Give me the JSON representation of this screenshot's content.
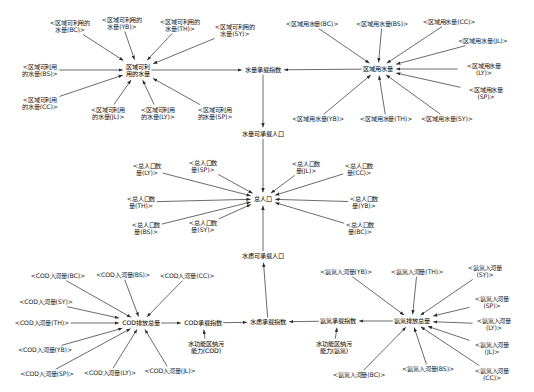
{
  "diagram": {
    "type": "causal-loop-diagram",
    "width": 534,
    "height": 392,
    "edge_color": "#2b2b2b",
    "text_color": "#141414",
    "background": "#ffffff",
    "regions": [
      "BC",
      "BS",
      "CC",
      "JL",
      "LY",
      "SP",
      "SY",
      "TH",
      "YB"
    ],
    "nodes": [
      {
        "id": "water_avail_BC",
        "label": "<区域可利用的\n水量(BC)>",
        "x": 70,
        "y": 26,
        "kind": "shadow"
      },
      {
        "id": "water_avail_YB",
        "label": "<区域可利用的\n水量(YB)>",
        "x": 122,
        "y": 23,
        "kind": "shadow"
      },
      {
        "id": "water_avail_TH",
        "label": "<区域可利用的\n水量(TH)>",
        "x": 180,
        "y": 25,
        "kind": "shadow"
      },
      {
        "id": "water_avail_SY",
        "label": "<区域可利用的\n水量(SY)>",
        "x": 235,
        "y": 30,
        "kind": "shadow"
      },
      {
        "id": "water_avail_BS",
        "label": "<区域可利用\n的水量(BS)>",
        "x": 40,
        "y": 70,
        "kind": "shadow"
      },
      {
        "id": "water_avail_CC",
        "label": "<区域可利用\n的水量(CC)>",
        "x": 40,
        "y": 103,
        "kind": "shadow"
      },
      {
        "id": "water_avail_JL",
        "label": "<区域可利用\n的水量(JL)>",
        "x": 108,
        "y": 113,
        "kind": "shadow"
      },
      {
        "id": "water_avail_LY",
        "label": "<区域可利用\n的水量(LY)>",
        "x": 158,
        "y": 113,
        "kind": "shadow"
      },
      {
        "id": "water_avail_SP",
        "label": "<区域可利用\n的水量(SP)>",
        "x": 215,
        "y": 113,
        "kind": "shadow"
      },
      {
        "id": "water_avail",
        "label": "区域可利\n用的水量",
        "x": 138,
        "y": 70,
        "kind": "core"
      },
      {
        "id": "water_use_BC",
        "label": "<区域用水量(BC)>",
        "x": 312,
        "y": 24,
        "kind": "shadow"
      },
      {
        "id": "water_use_BS",
        "label": "<区域用水量(BS)>",
        "x": 382,
        "y": 24,
        "kind": "shadow"
      },
      {
        "id": "water_use_CC",
        "label": "<区域用水量(CC)>",
        "x": 449,
        "y": 22,
        "kind": "shadow"
      },
      {
        "id": "water_use_JL",
        "label": "<区域用水量(JL)>",
        "x": 483,
        "y": 41,
        "kind": "shadow"
      },
      {
        "id": "water_use_LY",
        "label": "<区域用水量(LY)>",
        "x": 484,
        "y": 69,
        "kind": "shadow"
      },
      {
        "id": "water_use_SP",
        "label": "<区域用水量(SP)>",
        "x": 486,
        "y": 93,
        "kind": "shadow"
      },
      {
        "id": "water_use_YB",
        "label": "<区域用水量(YB)>",
        "x": 318,
        "y": 119,
        "kind": "shadow"
      },
      {
        "id": "water_use_TH",
        "label": "<区域用水量(TH)>",
        "x": 386,
        "y": 119,
        "kind": "shadow"
      },
      {
        "id": "water_use_SY",
        "label": "<区域用水量(SY)>",
        "x": 447,
        "y": 119,
        "kind": "shadow"
      },
      {
        "id": "water_use",
        "label": "区域用水量",
        "x": 378,
        "y": 69,
        "kind": "core"
      },
      {
        "id": "water_qty_index",
        "label": "水量承载指数",
        "x": 263,
        "y": 70,
        "kind": "core"
      },
      {
        "id": "water_qty_pop",
        "label": "水量可承载人口",
        "x": 263,
        "y": 134,
        "kind": "core"
      },
      {
        "id": "pop_LY",
        "label": "<总人口数\n量(LY)>",
        "x": 147,
        "y": 169,
        "kind": "shadow"
      },
      {
        "id": "pop_SP",
        "label": "<总人口数\n量(SP)>",
        "x": 203,
        "y": 166,
        "kind": "shadow"
      },
      {
        "id": "pop_JL",
        "label": "<总人口数\n量(JL)>",
        "x": 306,
        "y": 167,
        "kind": "shadow"
      },
      {
        "id": "pop_CC",
        "label": "<总人口数\n量(CC)>",
        "x": 359,
        "y": 169,
        "kind": "shadow"
      },
      {
        "id": "pop_TH",
        "label": "<总人口数\n量(TH)>",
        "x": 141,
        "y": 202,
        "kind": "shadow"
      },
      {
        "id": "pop_YB",
        "label": "<总人口数\n量(YB)>",
        "x": 364,
        "y": 202,
        "kind": "shadow"
      },
      {
        "id": "pop_BS",
        "label": "<总人口数\n量(BS)>",
        "x": 146,
        "y": 228,
        "kind": "shadow"
      },
      {
        "id": "pop_SY",
        "label": "<总人口数\n量(SY)>",
        "x": 203,
        "y": 226,
        "kind": "shadow"
      },
      {
        "id": "pop_BC",
        "label": "<总人口数\n量(BC)>",
        "x": 360,
        "y": 228,
        "kind": "shadow"
      },
      {
        "id": "pop_total",
        "label": "总人口",
        "x": 263,
        "y": 199,
        "kind": "core"
      },
      {
        "id": "water_qual_pop",
        "label": "水质可承载人口",
        "x": 263,
        "y": 256,
        "kind": "core"
      },
      {
        "id": "cod_BC",
        "label": "<COD入河量(BC)>",
        "x": 58,
        "y": 276,
        "kind": "shadow"
      },
      {
        "id": "cod_BS",
        "label": "<COD入河量(BS)>",
        "x": 123,
        "y": 275,
        "kind": "shadow"
      },
      {
        "id": "cod_CC",
        "label": "<COD入河量(CC)>",
        "x": 187,
        "y": 276,
        "kind": "shadow"
      },
      {
        "id": "cod_SY",
        "label": "<COD入河量(SY)>",
        "x": 46,
        "y": 302,
        "kind": "shadow"
      },
      {
        "id": "cod_TH",
        "label": "<COD入河量(TH)>",
        "x": 42,
        "y": 323,
        "kind": "shadow"
      },
      {
        "id": "cod_YB",
        "label": "<COD入河量(YB)>",
        "x": 45,
        "y": 350,
        "kind": "shadow"
      },
      {
        "id": "cod_SP",
        "label": "<COD入河量(SP)>",
        "x": 47,
        "y": 374,
        "kind": "shadow"
      },
      {
        "id": "cod_LY",
        "label": "<COD入河量(LY)>",
        "x": 110,
        "y": 373,
        "kind": "shadow"
      },
      {
        "id": "cod_JL",
        "label": "<COD入河量(JL)>",
        "x": 170,
        "y": 371,
        "kind": "shadow"
      },
      {
        "id": "cod_total",
        "label": "COD排放总量",
        "x": 141,
        "y": 323,
        "kind": "core"
      },
      {
        "id": "cod_index",
        "label": "COD承载指数",
        "x": 203,
        "y": 323,
        "kind": "core"
      },
      {
        "id": "cod_capacity",
        "label": "水功能区纳污\n能力(COD)",
        "x": 206,
        "y": 347,
        "kind": "core"
      },
      {
        "id": "nh_YB",
        "label": "<氨氮入河量(YB)>",
        "x": 346,
        "y": 272,
        "kind": "shadow"
      },
      {
        "id": "nh_TH",
        "label": "<氨氮入河量(TH)>",
        "x": 417,
        "y": 272,
        "kind": "shadow"
      },
      {
        "id": "nh_SY",
        "label": "<氨氮入河量(SY)>",
        "x": 485,
        "y": 271,
        "kind": "shadow"
      },
      {
        "id": "nh_SP",
        "label": "<氨氮入河量(SP)>",
        "x": 492,
        "y": 302,
        "kind": "shadow"
      },
      {
        "id": "nh_LY",
        "label": "<氨氮入河量(LY)>",
        "x": 494,
        "y": 324,
        "kind": "shadow"
      },
      {
        "id": "nh_JL",
        "label": "<氨氮入河量(JL)>",
        "x": 492,
        "y": 348,
        "kind": "shadow"
      },
      {
        "id": "nh_BC",
        "label": "<氨氮入河量(BC)>",
        "x": 359,
        "y": 375,
        "kind": "shadow"
      },
      {
        "id": "nh_BS",
        "label": "<氨氮入河量(BS)>",
        "x": 428,
        "y": 369,
        "kind": "shadow"
      },
      {
        "id": "nh_CC",
        "label": "<氨氮入河量(CC)>",
        "x": 492,
        "y": 374,
        "kind": "shadow"
      },
      {
        "id": "nh_total",
        "label": "氨氮排放总量",
        "x": 412,
        "y": 321,
        "kind": "core"
      },
      {
        "id": "nh_index",
        "label": "氨氮承载指数",
        "x": 338,
        "y": 321,
        "kind": "core"
      },
      {
        "id": "nh_capacity",
        "label": "水功能区纳污\n能力(氨氮)",
        "x": 334,
        "y": 347,
        "kind": "core"
      },
      {
        "id": "water_qual_index",
        "label": "水质承载指数",
        "x": 268,
        "y": 322,
        "kind": "core"
      }
    ],
    "edges": [
      {
        "from": "water_avail_BC",
        "to": "water_avail"
      },
      {
        "from": "water_avail_YB",
        "to": "water_avail"
      },
      {
        "from": "water_avail_TH",
        "to": "water_avail"
      },
      {
        "from": "water_avail_SY",
        "to": "water_avail"
      },
      {
        "from": "water_avail_BS",
        "to": "water_avail"
      },
      {
        "from": "water_avail_CC",
        "to": "water_avail"
      },
      {
        "from": "water_avail_JL",
        "to": "water_avail"
      },
      {
        "from": "water_avail_LY",
        "to": "water_avail"
      },
      {
        "from": "water_avail_SP",
        "to": "water_avail"
      },
      {
        "from": "water_avail",
        "to": "water_qty_index"
      },
      {
        "from": "water_use_BC",
        "to": "water_use"
      },
      {
        "from": "water_use_BS",
        "to": "water_use"
      },
      {
        "from": "water_use_CC",
        "to": "water_use"
      },
      {
        "from": "water_use_JL",
        "to": "water_use"
      },
      {
        "from": "water_use_LY",
        "to": "water_use"
      },
      {
        "from": "water_use_SP",
        "to": "water_use"
      },
      {
        "from": "water_use_YB",
        "to": "water_use"
      },
      {
        "from": "water_use_TH",
        "to": "water_use"
      },
      {
        "from": "water_use_SY",
        "to": "water_use"
      },
      {
        "from": "water_use",
        "to": "water_qty_index"
      },
      {
        "from": "water_qty_index",
        "to": "water_qty_pop"
      },
      {
        "from": "water_qty_pop",
        "to": "pop_total"
      },
      {
        "from": "pop_LY",
        "to": "pop_total"
      },
      {
        "from": "pop_SP",
        "to": "pop_total"
      },
      {
        "from": "pop_JL",
        "to": "pop_total"
      },
      {
        "from": "pop_CC",
        "to": "pop_total"
      },
      {
        "from": "pop_TH",
        "to": "pop_total"
      },
      {
        "from": "pop_YB",
        "to": "pop_total"
      },
      {
        "from": "pop_BS",
        "to": "pop_total"
      },
      {
        "from": "pop_SY",
        "to": "pop_total"
      },
      {
        "from": "pop_BC",
        "to": "pop_total"
      },
      {
        "from": "water_qual_pop",
        "to": "pop_total"
      },
      {
        "from": "water_qual_index",
        "to": "water_qual_pop"
      },
      {
        "from": "cod_BC",
        "to": "cod_total"
      },
      {
        "from": "cod_BS",
        "to": "cod_total"
      },
      {
        "from": "cod_CC",
        "to": "cod_total"
      },
      {
        "from": "cod_SY",
        "to": "cod_total"
      },
      {
        "from": "cod_TH",
        "to": "cod_total"
      },
      {
        "from": "cod_YB",
        "to": "cod_total"
      },
      {
        "from": "cod_SP",
        "to": "cod_total"
      },
      {
        "from": "cod_LY",
        "to": "cod_total"
      },
      {
        "from": "cod_JL",
        "to": "cod_total"
      },
      {
        "from": "cod_total",
        "to": "cod_index"
      },
      {
        "from": "cod_capacity",
        "to": "cod_index"
      },
      {
        "from": "cod_index",
        "to": "water_qual_index"
      },
      {
        "from": "nh_YB",
        "to": "nh_total"
      },
      {
        "from": "nh_TH",
        "to": "nh_total"
      },
      {
        "from": "nh_SY",
        "to": "nh_total"
      },
      {
        "from": "nh_SP",
        "to": "nh_total"
      },
      {
        "from": "nh_LY",
        "to": "nh_total"
      },
      {
        "from": "nh_JL",
        "to": "nh_total"
      },
      {
        "from": "nh_BC",
        "to": "nh_total"
      },
      {
        "from": "nh_BS",
        "to": "nh_total"
      },
      {
        "from": "nh_CC",
        "to": "nh_total"
      },
      {
        "from": "nh_total",
        "to": "nh_index"
      },
      {
        "from": "nh_capacity",
        "to": "nh_index"
      },
      {
        "from": "nh_index",
        "to": "water_qual_index"
      }
    ]
  }
}
